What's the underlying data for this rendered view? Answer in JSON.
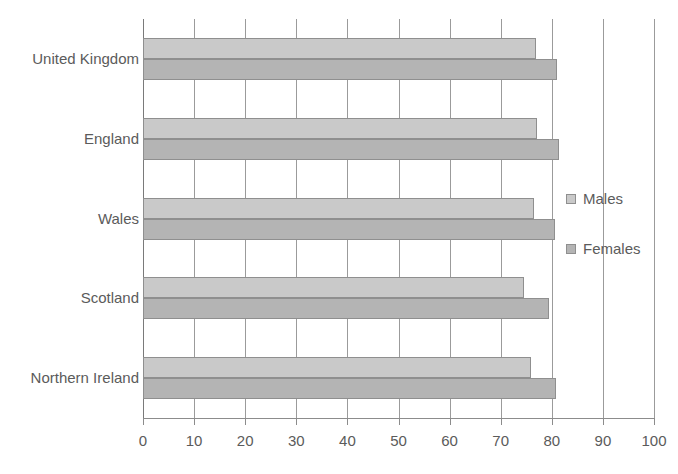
{
  "chart_data": {
    "type": "bar",
    "orientation": "horizontal",
    "title": "",
    "subtitle": "",
    "xlabel": "",
    "ylabel": "",
    "xlim": [
      0,
      100
    ],
    "ylim": null,
    "grid": true,
    "grid_axis": "x",
    "legend_position": "right",
    "categories": [
      "United Kingdom",
      "England",
      "Wales",
      "Scotland",
      "Northern Ireland"
    ],
    "x_ticks": [
      0,
      10,
      20,
      30,
      40,
      50,
      60,
      70,
      80,
      90,
      100
    ],
    "x_tick_labels": [
      "0",
      "10",
      "20",
      "30",
      "40",
      "50",
      "60",
      "70",
      "80",
      "90",
      "100"
    ],
    "series": [
      {
        "name": "Males",
        "color": "#c9c9c9",
        "values": [
          77.0,
          77.1,
          76.6,
          74.5,
          75.9
        ]
      },
      {
        "name": "Females",
        "color": "#b4b4b4",
        "values": [
          81.0,
          81.4,
          80.6,
          79.4,
          80.8
        ]
      }
    ],
    "legend": [
      "Males",
      "Females"
    ],
    "annotations": []
  },
  "colors": {
    "males": "#c9c9c9",
    "females": "#b4b4b4",
    "gridline": "#9b9b9b",
    "axis": "#8c8c8c",
    "text": "#5b5b5b",
    "bar_border": "#8f8f8f",
    "background": "#ffffff"
  }
}
